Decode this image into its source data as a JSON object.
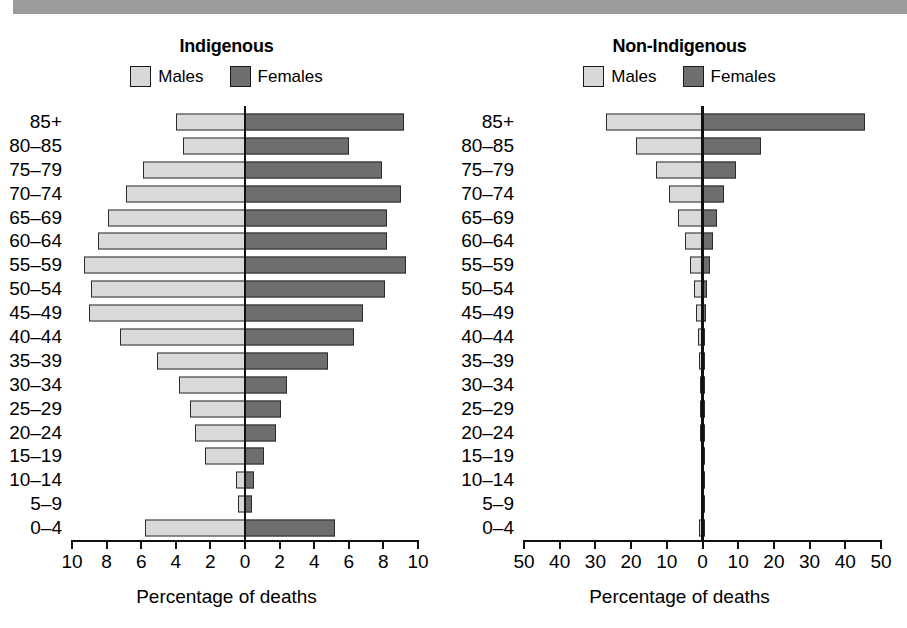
{
  "banner": {
    "name": "top-gray-banner",
    "color": "#9b9b9b"
  },
  "colors": {
    "males": "#d9d9d9",
    "females": "#6e6e6e",
    "axis": "#111111"
  },
  "legend": {
    "males_label": "Males",
    "females_label": "Females"
  },
  "axis_title": "Percentage of deaths",
  "age_groups": [
    "85+",
    "80–85",
    "75–79",
    "70–74",
    "65–69",
    "60–64",
    "55–59",
    "50–54",
    "45–49",
    "40–44",
    "35–39",
    "30–34",
    "25–29",
    "20–24",
    "15–19",
    "10–14",
    "5–9",
    "0–4"
  ],
  "chart_data": [
    {
      "type": "bar",
      "subtype": "population-pyramid",
      "title": "Indigenous",
      "xlabel": "Percentage of deaths",
      "ylabel": "",
      "categories": [
        "85+",
        "80–85",
        "75–79",
        "70–74",
        "65–69",
        "60–64",
        "55–59",
        "50–54",
        "45–49",
        "40–44",
        "35–39",
        "30–34",
        "25–29",
        "20–24",
        "15–19",
        "10–14",
        "5–9",
        "0–4"
      ],
      "series": [
        {
          "name": "Males",
          "side": "left",
          "values": [
            4.0,
            3.6,
            5.9,
            6.9,
            7.9,
            8.5,
            9.3,
            8.9,
            9.0,
            7.2,
            5.1,
            3.8,
            3.2,
            2.9,
            2.3,
            0.5,
            0.4,
            5.8
          ]
        },
        {
          "name": "Females",
          "side": "right",
          "values": [
            9.2,
            6.0,
            7.9,
            9.0,
            8.2,
            8.2,
            9.3,
            8.1,
            6.8,
            6.3,
            4.8,
            2.4,
            2.1,
            1.8,
            1.1,
            0.5,
            0.4,
            5.2
          ]
        }
      ],
      "xlim": [
        -10,
        10
      ],
      "xticks": [
        -10,
        -8,
        -6,
        -4,
        -2,
        0,
        2,
        4,
        6,
        8,
        10
      ],
      "xticklabels": [
        "10",
        "8",
        "6",
        "4",
        "2",
        "0",
        "2",
        "4",
        "6",
        "8",
        "10"
      ],
      "grid": false,
      "legend_position": "top"
    },
    {
      "type": "bar",
      "subtype": "population-pyramid",
      "title": "Non-Indigenous",
      "xlabel": "Percentage of deaths",
      "ylabel": "",
      "categories": [
        "85+",
        "80–85",
        "75–79",
        "70–74",
        "65–69",
        "60–64",
        "55–59",
        "50–54",
        "45–49",
        "40–44",
        "35–39",
        "30–34",
        "25–29",
        "20–24",
        "15–19",
        "10–14",
        "5–9",
        "0–4"
      ],
      "series": [
        {
          "name": "Males",
          "side": "left",
          "values": [
            27.0,
            18.5,
            13.0,
            9.5,
            7.0,
            5.0,
            3.4,
            2.4,
            1.7,
            1.3,
            1.0,
            0.8,
            0.7,
            0.7,
            0.5,
            0.3,
            0.2,
            0.9
          ]
        },
        {
          "name": "Females",
          "side": "right",
          "values": [
            45.5,
            16.5,
            9.5,
            6.0,
            4.0,
            3.0,
            2.0,
            1.4,
            1.0,
            0.8,
            0.6,
            0.5,
            0.4,
            0.4,
            0.3,
            0.2,
            0.2,
            0.8
          ]
        }
      ],
      "xlim": [
        -50,
        50
      ],
      "xticks": [
        -50,
        -40,
        -30,
        -20,
        -10,
        0,
        10,
        20,
        30,
        40,
        50
      ],
      "xticklabels": [
        "50",
        "40",
        "30",
        "20",
        "10",
        "0",
        "10",
        "20",
        "30",
        "40",
        "50"
      ],
      "grid": false,
      "legend_position": "top"
    }
  ]
}
